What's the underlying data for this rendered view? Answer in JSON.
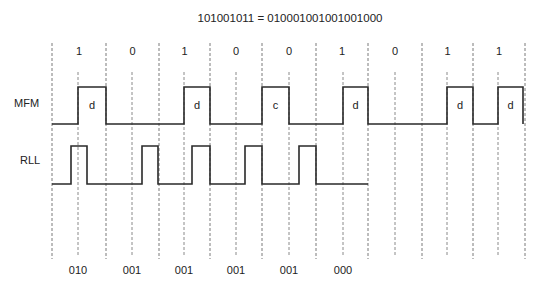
{
  "title": "101001011 = 010001001001001000",
  "colors": {
    "wave": "#2a2a2a",
    "grid": "#7a7a7a",
    "background": "#ffffff",
    "text": "#222222"
  },
  "data_bits": [
    "1",
    "0",
    "1",
    "0",
    "0",
    "1",
    "0",
    "1",
    "1"
  ],
  "row_labels": {
    "mfm": "MFM",
    "rll": "RLL"
  },
  "mfm_pulse_labels": [
    "d",
    "d",
    "c",
    "d",
    "d",
    "d"
  ],
  "rll_group_labels": [
    "010",
    "001",
    "001",
    "001",
    "001",
    "000"
  ],
  "geometry": {
    "bit_boundaries_x": [
      52,
      106,
      159,
      210,
      262,
      316,
      368,
      422,
      473,
      525
    ],
    "bit_midpoints_x": [
      78,
      132,
      184,
      236,
      289,
      343,
      395,
      447,
      498
    ],
    "mfm": {
      "high_y": 87,
      "low_y": 124,
      "pulses": [
        [
          78,
          106
        ],
        [
          184,
          210
        ],
        [
          262,
          289
        ],
        [
          343,
          368
        ],
        [
          447,
          473
        ],
        [
          498,
          523
        ]
      ]
    },
    "rll": {
      "high_y": 146,
      "low_y": 184,
      "end_x": 368,
      "pulses": [
        [
          71,
          87
        ],
        [
          142,
          158
        ],
        [
          192,
          210
        ],
        [
          245,
          262
        ],
        [
          299,
          316
        ]
      ]
    }
  }
}
